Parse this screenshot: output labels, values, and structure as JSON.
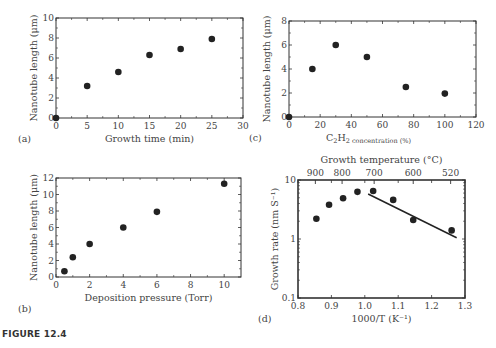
{
  "figure_caption": "FIGURE 12.4",
  "chart_data": [
    {
      "panel": "(a)",
      "type": "scatter",
      "xlabel": "Growth time (min)",
      "ylabel": "Nanotube length (μm)",
      "xlim": [
        0,
        30
      ],
      "ylim": [
        0,
        10
      ],
      "xticks": [
        0,
        5,
        10,
        15,
        20,
        25,
        30
      ],
      "yticks": [
        0,
        2,
        4,
        6,
        8,
        10
      ],
      "x": [
        0,
        5,
        10,
        15,
        20,
        25
      ],
      "y": [
        0,
        3.2,
        4.6,
        6.3,
        6.9,
        7.9
      ],
      "grid": false
    },
    {
      "panel": "(b)",
      "type": "scatter",
      "xlabel": "Deposition pressure (Torr)",
      "ylabel": "Nanotube length (μm)",
      "xlim": [
        0,
        11
      ],
      "ylim": [
        0,
        12
      ],
      "xticks": [
        0,
        2,
        4,
        6,
        8,
        10
      ],
      "yticks": [
        0,
        2,
        4,
        6,
        8,
        10,
        12
      ],
      "x": [
        0.5,
        1,
        2,
        4,
        6,
        10
      ],
      "y": [
        0.7,
        2.4,
        4.0,
        6.0,
        7.9,
        11.3
      ],
      "grid": false
    },
    {
      "panel": "(c)",
      "type": "scatter",
      "xlabel": "C2H2 concentration (%)",
      "xlabel_main": "C",
      "xlabel_sub1": "2",
      "xlabel_mid": "H",
      "xlabel_sub2": "2 concentration (%)",
      "ylabel": "Nanotube length (μm)",
      "xlim": [
        0,
        120
      ],
      "ylim": [
        0,
        8
      ],
      "xticks": [
        0,
        20,
        40,
        60,
        80,
        100,
        120
      ],
      "yticks": [
        0,
        2,
        4,
        6,
        8
      ],
      "x": [
        0,
        15,
        30,
        50,
        75,
        100
      ],
      "y": [
        0,
        4.0,
        6.0,
        5.0,
        2.5,
        1.95
      ],
      "grid": false
    },
    {
      "panel": "(d)",
      "type": "scatter",
      "xlabel": "1000/T (K⁻¹)",
      "ylabel": "Growth rate (nm S⁻¹)",
      "top_xlabel": "Growth temperature (°C)",
      "yscale": "log",
      "xlim": [
        0.8,
        1.3
      ],
      "ylim": [
        0.1,
        10
      ],
      "xticks": [
        0.8,
        0.9,
        1.0,
        1.1,
        1.2,
        1.3
      ],
      "xtick_labels": [
        "0.8",
        "0.9",
        "1.0",
        "1.1",
        "1.2",
        "1.3"
      ],
      "yticks": [
        0.1,
        1,
        10
      ],
      "ytick_labels": [
        "0.1",
        "1",
        "10"
      ],
      "top_ticks": [
        {
          "label": "900",
          "x": 0.852
        },
        {
          "label": "800",
          "x": 0.932
        },
        {
          "label": "700",
          "x": 1.028
        },
        {
          "label": "600",
          "x": 1.145
        },
        {
          "label": "520",
          "x": 1.257
        }
      ],
      "x": [
        0.855,
        0.893,
        0.935,
        0.978,
        1.025,
        1.085,
        1.145,
        1.26
      ],
      "y": [
        2.2,
        3.8,
        4.9,
        6.3,
        6.5,
        4.6,
        2.1,
        1.4
      ],
      "fit_line": {
        "x": [
          1.01,
          1.275
        ],
        "y": [
          5.8,
          1.05
        ]
      },
      "grid": false
    }
  ],
  "layout": {
    "frames": [
      {
        "left": 56,
        "top": 18,
        "right": 243,
        "bottom": 118
      },
      {
        "left": 56,
        "top": 178,
        "right": 241,
        "bottom": 277
      },
      {
        "left": 289,
        "top": 21,
        "right": 476,
        "bottom": 117
      },
      {
        "left": 298,
        "top": 180,
        "right": 465,
        "bottom": 298
      }
    ],
    "marker_color": "#222222",
    "axis_color": "#333333"
  }
}
